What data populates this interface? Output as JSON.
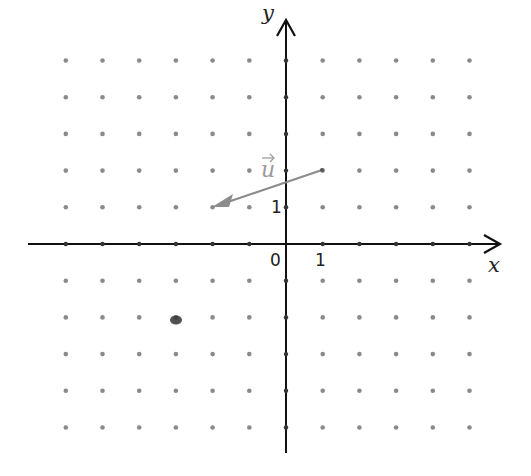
{
  "diagram": {
    "type": "coordinate-grid",
    "axes": {
      "x_label": "x",
      "y_label": "y",
      "origin_label": "0",
      "x_unit_label": "1",
      "y_unit_label": "1"
    },
    "grid": {
      "origin_px": [
        286,
        244
      ],
      "unit_px": 36.7,
      "x_range": [
        -6,
        5
      ],
      "y_range": [
        -5,
        5
      ],
      "dot_color": "#8a8a8a"
    },
    "vector": {
      "label": "u",
      "from": [
        1,
        2
      ],
      "to": [
        -2,
        1
      ],
      "color": "#8c8c8c"
    },
    "extra_mark": {
      "position": [
        -3,
        -2
      ],
      "description": "dark smudge"
    },
    "colors": {
      "axis": "#111111",
      "vector": "#8c8c8c",
      "dots": "#8a8a8a"
    }
  }
}
